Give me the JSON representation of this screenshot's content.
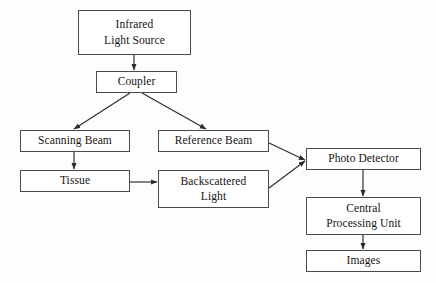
{
  "diagram": {
    "type": "flowchart",
    "background_color": "#fdfdfc",
    "box_border_color": "#4a4a4a",
    "box_fill_color": "#ffffff",
    "connector_color": "#2b2b2b",
    "text_color": "#141414",
    "nodes": [
      {
        "id": "infrared-light-source",
        "label": "Infrared\nLight Source",
        "x": 78,
        "y": 10,
        "w": 113,
        "h": 45
      },
      {
        "id": "coupler",
        "label": "Coupler",
        "x": 96,
        "y": 71,
        "w": 81,
        "h": 22
      },
      {
        "id": "scanning-beam",
        "label": "Scanning Beam",
        "x": 20,
        "y": 130,
        "w": 110,
        "h": 22
      },
      {
        "id": "reference-beam",
        "label": "Reference Beam",
        "x": 158,
        "y": 130,
        "w": 111,
        "h": 22
      },
      {
        "id": "tissue",
        "label": "Tissue",
        "x": 20,
        "y": 170,
        "w": 110,
        "h": 22
      },
      {
        "id": "backscattered-light",
        "label": "Backscattered\nLight",
        "x": 158,
        "y": 170,
        "w": 111,
        "h": 38
      },
      {
        "id": "photo-detector",
        "label": "Photo Detector",
        "x": 306,
        "y": 148,
        "w": 115,
        "h": 22
      },
      {
        "id": "central-processing-unit",
        "label": "Central\nProcessing Unit",
        "x": 306,
        "y": 197,
        "w": 115,
        "h": 38
      },
      {
        "id": "images",
        "label": "Images",
        "x": 306,
        "y": 250,
        "w": 115,
        "h": 22
      }
    ],
    "connectors": [
      {
        "id": "infrared-to-coupler",
        "from": "infrared-light-source",
        "to": "coupler",
        "kind": "straight",
        "x1": 134,
        "y1": 55,
        "x2": 134,
        "y2": 70
      },
      {
        "id": "coupler-to-scanning-beam",
        "from": "coupler",
        "to": "scanning-beam",
        "kind": "diagonal",
        "x1": 130,
        "y1": 93,
        "x2": 74,
        "y2": 129
      },
      {
        "id": "coupler-to-reference-beam",
        "from": "coupler",
        "to": "reference-beam",
        "kind": "diagonal",
        "x1": 142,
        "y1": 93,
        "x2": 206,
        "y2": 129
      },
      {
        "id": "scanning-beam-to-tissue",
        "from": "scanning-beam",
        "to": "tissue",
        "kind": "straight",
        "x1": 74,
        "y1": 152,
        "x2": 74,
        "y2": 169
      },
      {
        "id": "tissue-to-backscattered-light",
        "from": "tissue",
        "to": "backscattered-light",
        "kind": "straight",
        "x1": 130,
        "y1": 182,
        "x2": 157,
        "y2": 182
      },
      {
        "id": "reference-beam-to-photo-detector",
        "from": "reference-beam",
        "to": "photo-detector",
        "kind": "diagonal",
        "x1": 269,
        "y1": 143,
        "x2": 305,
        "y2": 160
      },
      {
        "id": "backscattered-light-to-photo-detector",
        "from": "backscattered-light",
        "to": "photo-detector",
        "kind": "diagonal",
        "x1": 269,
        "y1": 188,
        "x2": 305,
        "y2": 161
      },
      {
        "id": "photo-detector-to-cpu",
        "from": "photo-detector",
        "to": "central-processing-unit",
        "kind": "straight",
        "x1": 363,
        "y1": 170,
        "x2": 363,
        "y2": 196
      },
      {
        "id": "cpu-to-images",
        "from": "central-processing-unit",
        "to": "images",
        "kind": "straight",
        "x1": 363,
        "y1": 235,
        "x2": 363,
        "y2": 249
      }
    ]
  }
}
